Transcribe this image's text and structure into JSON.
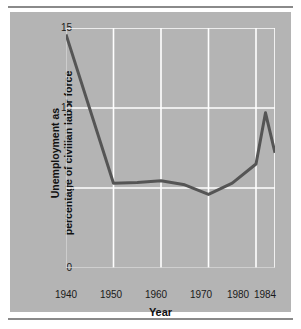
{
  "figure": {
    "background_color": "#ffffff",
    "panel_color": "#b4b4b4",
    "rule_color": "#8a8a8a"
  },
  "chart_data": {
    "type": "line",
    "title": "",
    "xlabel": "Year",
    "ylabel_line1": "Unemployment as",
    "ylabel_line2": "percentage of civilian labor force",
    "ylabel": "Unemployment as\npercentage of civilian labor force",
    "xlim": [
      1940,
      1984
    ],
    "ylim": [
      0,
      15
    ],
    "xticks": [
      1940,
      1950,
      1960,
      1970,
      1980,
      1984
    ],
    "xticklabels": [
      "1940",
      "1950",
      "1960",
      "1970",
      "1980",
      "1984"
    ],
    "yticks": [
      0,
      5,
      10,
      15
    ],
    "yticklabels": [
      "0",
      "5",
      "10",
      "15"
    ],
    "grid": true,
    "grid_color": "#ffffff",
    "legend": null,
    "line_color": "#555555",
    "line_width": 3,
    "x": [
      1940,
      1950,
      1955,
      1960,
      1965,
      1970,
      1975,
      1980,
      1982,
      1984
    ],
    "values": [
      14.6,
      5.3,
      5.35,
      5.45,
      5.2,
      4.6,
      5.3,
      6.5,
      9.7,
      7.2
    ],
    "series": [
      {
        "name": "Unemployment rate",
        "x": [
          1940,
          1950,
          1955,
          1960,
          1965,
          1970,
          1975,
          1980,
          1982,
          1984
        ],
        "values": [
          14.6,
          5.3,
          5.35,
          5.45,
          5.2,
          4.6,
          5.3,
          6.5,
          9.7,
          7.2
        ]
      }
    ]
  }
}
